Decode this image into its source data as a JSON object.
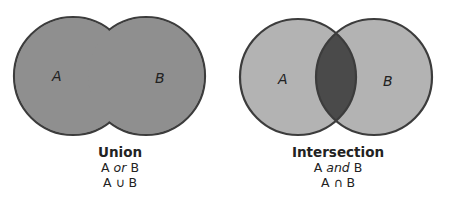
{
  "colors": {
    "union_fill": "#8f8f8f",
    "light_fill": "#b3b3b3",
    "intersection_fill": "#4a4a4a",
    "outline": "#3c3c3c"
  },
  "diagrams": [
    {
      "id": "union",
      "set_a_label": "A",
      "set_b_label": "B",
      "title": "Union",
      "phrase_left": "A",
      "phrase_connector": "or",
      "phrase_right": "B",
      "notation": "A ∪ B"
    },
    {
      "id": "intersection",
      "set_a_label": "A",
      "set_b_label": "B",
      "title": "Intersection",
      "phrase_left": "A",
      "phrase_connector": "and",
      "phrase_right": "B",
      "notation": "A ∩ B"
    }
  ]
}
